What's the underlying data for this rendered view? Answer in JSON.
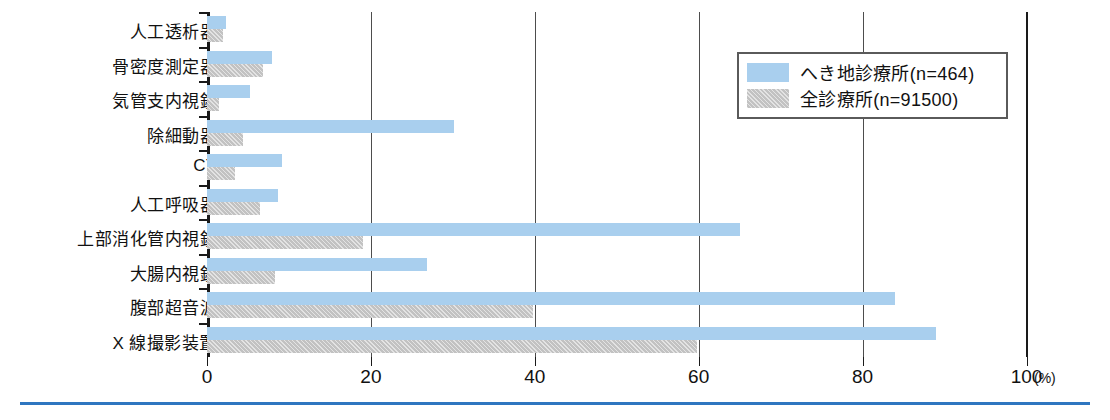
{
  "chart_data": {
    "type": "bar",
    "orientation": "horizontal",
    "title": "",
    "xlabel": "(%)",
    "ylabel": "",
    "xlim": [
      0,
      100
    ],
    "xticks": [
      0,
      20,
      40,
      60,
      80,
      100
    ],
    "xtick_labels": [
      "0",
      "20",
      "40",
      "60",
      "80",
      "100"
    ],
    "unit_label": "(%)",
    "grid": "vertical",
    "legend_position": "top-right",
    "categories": [
      "人工透析器",
      "骨密度測定器",
      "気管支内視鏡",
      "除細動器",
      "CT",
      "人工呼吸器",
      "上部消化管内視鏡",
      "大腸内視鏡",
      "腹部超音波",
      "X 線撮影装置"
    ],
    "series": [
      {
        "name": "へき地診療所(n=464)",
        "color": "#a9cfee",
        "values": [
          2.3,
          7.9,
          5.2,
          30.2,
          9.1,
          8.7,
          65.0,
          26.8,
          84.0,
          89.0
        ]
      },
      {
        "name": "全診療所(n=91500)",
        "color": "#c2c2c2",
        "values": [
          1.9,
          6.8,
          1.5,
          4.4,
          3.4,
          6.5,
          19.0,
          8.3,
          39.8,
          59.8
        ]
      }
    ]
  },
  "legend": {
    "items": [
      {
        "label": "へき地診療所(n=464)"
      },
      {
        "label": "全診療所(n=91500)"
      }
    ]
  },
  "axis": {
    "x_unit": "(%)",
    "tick_labels": [
      "0",
      "20",
      "40",
      "60",
      "80",
      "100"
    ]
  }
}
